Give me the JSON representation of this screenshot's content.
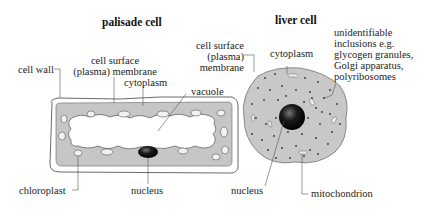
{
  "diagram": {
    "palisade": {
      "title": "palisade cell",
      "labels": {
        "cell_wall": "cell wall",
        "membrane_line1": "cell surface",
        "membrane_line2": "(plasma) membrane",
        "cytoplasm": "cytoplasm",
        "vacuole": "vacuole",
        "chloroplast": "chloroplast",
        "nucleus": "nucleus"
      }
    },
    "liver": {
      "title": "liver cell",
      "labels": {
        "membrane_line1": "cell surface",
        "membrane_line2": "(plasma)",
        "membrane_line3": "membrane",
        "cytoplasm": "cytoplasm",
        "inclusions_line1": "unidentifiable",
        "inclusions_line2": "inclusions e.g.",
        "inclusions_line3": "glycogen granules,",
        "inclusions_line4": "Golgi apparatus,",
        "inclusions_line5": "polyribosomes",
        "nucleus": "nucleus",
        "mitochondrion": "mitochondrion"
      }
    },
    "colors": {
      "cytoplasm_fill": "#c8c8c8",
      "nucleus_fill": "#111111",
      "outline": "#555555"
    }
  }
}
